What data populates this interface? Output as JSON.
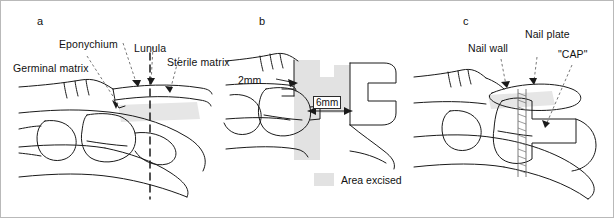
{
  "figure": {
    "background": "#ffffff",
    "border_color": "#b9b9b9",
    "ink_color": "#1a1a1a",
    "shade_color": "#e2e2e2",
    "panels": [
      {
        "letter": "a",
        "name": "nail-anatomy",
        "labels": [
          {
            "key": "germinal_matrix",
            "text": "Germinal matrix"
          },
          {
            "key": "eponychium",
            "text": "Eponychium"
          },
          {
            "key": "lunula",
            "text": "Lunula"
          },
          {
            "key": "sterile_matrix",
            "text": "Sterile matrix"
          }
        ]
      },
      {
        "letter": "b",
        "name": "excision-measurements",
        "labels": [
          {
            "key": "prox_measure",
            "text": "2mm"
          },
          {
            "key": "dist_measure",
            "text": "6mm"
          }
        ],
        "legend": {
          "swatch_color": "#e2e2e2",
          "text": "Area excised"
        }
      },
      {
        "letter": "c",
        "name": "cap-reconstruction",
        "labels": [
          {
            "key": "nail_wall",
            "text": "Nail wall"
          },
          {
            "key": "nail_plate",
            "text": "Nail plate"
          },
          {
            "key": "cap",
            "text": "\"CAP\""
          }
        ]
      }
    ]
  }
}
